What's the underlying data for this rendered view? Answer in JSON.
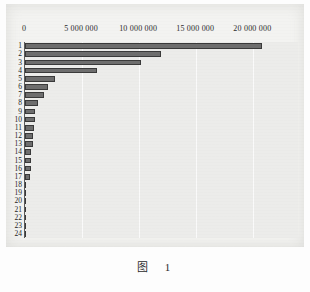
{
  "caption": "图　1",
  "colors": {
    "bar_fill": "#6e6e6e",
    "bar_stroke": "#3a3a3a",
    "plot_background": "#ececea",
    "page_background": "#f3f3f1",
    "gridline": "#fafafa",
    "axis": "#5b5b5b",
    "text": "#232323"
  },
  "chart_data": {
    "type": "bar",
    "orientation": "horizontal",
    "title": "",
    "subtitle": "",
    "xlabel": "",
    "ylabel": "",
    "xlim": [
      0,
      24000000
    ],
    "ylim": null,
    "grid": true,
    "legend": null,
    "legend_position": "none",
    "x_tick_labels": [
      "0",
      "5 000 000",
      "10 000 000",
      "15 000 000",
      "20 000 000"
    ],
    "x_tick_values": [
      0,
      5000000,
      10000000,
      15000000,
      20000000
    ],
    "axis_position": "top",
    "categories": [
      "1",
      "2",
      "3",
      "4",
      "5",
      "6",
      "7",
      "8",
      "9",
      "10",
      "11",
      "12",
      "13",
      "14",
      "15",
      "16",
      "17",
      "18",
      "19",
      "20",
      "21",
      "22",
      "23",
      "24"
    ],
    "values": [
      20800000,
      11900000,
      10200000,
      6300000,
      2650000,
      2050000,
      1700000,
      1150000,
      880000,
      840000,
      800000,
      730000,
      700000,
      560000,
      520000,
      500000,
      480000,
      90000,
      70000,
      60000,
      30000,
      25000,
      20000,
      15000
    ],
    "annotations": []
  }
}
